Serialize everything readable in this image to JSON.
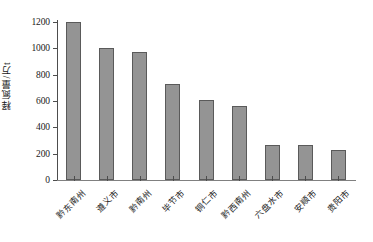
{
  "chart_data": {
    "type": "bar",
    "title": "",
    "xlabel": "",
    "ylabel": "释氮量/万t",
    "ylim": [
      0,
      1200
    ],
    "yticks": [
      0,
      200,
      400,
      600,
      800,
      1000,
      1200
    ],
    "ytick_labels": [
      "0",
      "200",
      "400",
      "600",
      "800",
      "1000",
      "1200"
    ],
    "grid": false,
    "legend": false,
    "bar_color": "#949494",
    "bar_edge_color": "#5a5a5a",
    "axis_color": "#4d4d4d",
    "categories": [
      "黔东南州",
      "遵义市",
      "黔南州",
      "毕节市",
      "铜仁市",
      "黔西南州",
      "六盘水市",
      "安顺市",
      "贵阳市"
    ],
    "values": [
      1200,
      1005,
      975,
      730,
      605,
      565,
      265,
      265,
      228
    ]
  }
}
